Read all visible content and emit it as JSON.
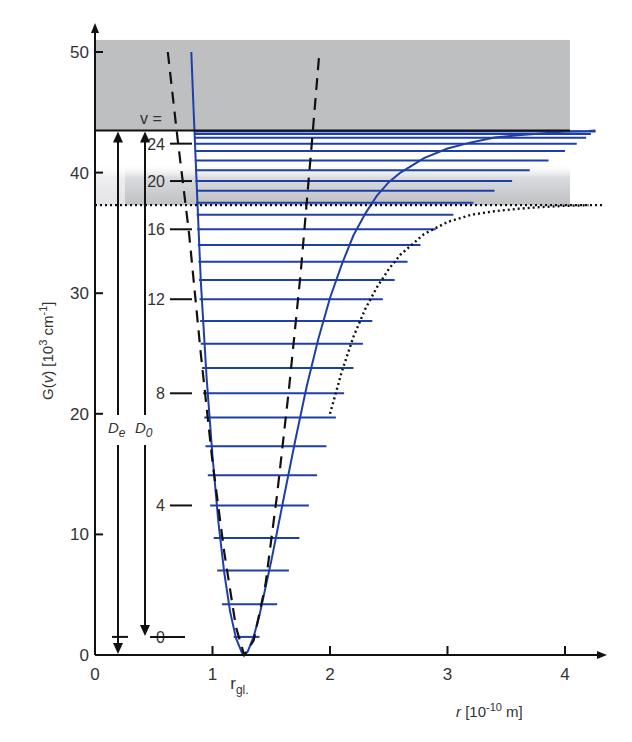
{
  "chart_data": {
    "type": "line",
    "title": "",
    "xlabel": "r [10^-10 m]",
    "xlabel_parts": {
      "var": "r",
      "unit_pre": " [10",
      "exp": "-10",
      "unit_post": " m]"
    },
    "ylabel": "G(v) [10^3 cm^-1]",
    "ylabel_parts": {
      "pre": "G(",
      "var": "v",
      "mid": ") [10",
      "exp": "3",
      "mid2": " cm",
      "exp2": "-1",
      "post": "]"
    },
    "xlim": [
      0,
      4.3
    ],
    "ylim": [
      0,
      51
    ],
    "x_ticks": [
      "0",
      "1",
      "2",
      "3",
      "4"
    ],
    "x_tick_values": [
      0,
      1,
      2,
      3,
      4
    ],
    "y_ticks": [
      "0",
      "10",
      "20",
      "30",
      "40",
      "50"
    ],
    "y_tick_values": [
      0,
      10,
      20,
      30,
      40,
      50
    ],
    "grid": false,
    "annotations": {
      "r_eq_label": "r",
      "r_eq_sub": "gl.",
      "r_eq": 1.27,
      "v_equals": "v =",
      "De_label": "D",
      "De_sub": "e",
      "D0_label": "D",
      "D0_sub": "0",
      "v_tick_labels": [
        "0",
        "4",
        "8",
        "12",
        "16",
        "20",
        "24"
      ]
    },
    "dissociation_limit_De": 43.5,
    "dissociation_limit_D0_dotted": 37.3,
    "zero_point_energy": 1.5,
    "vibrational_levels": {
      "v": [
        0,
        1,
        2,
        3,
        4,
        5,
        6,
        7,
        8,
        9,
        10,
        11,
        12,
        13,
        14,
        15,
        16,
        17,
        18,
        19,
        20,
        21,
        22,
        23,
        24,
        25,
        26,
        27
      ],
      "G": [
        1.5,
        4.2,
        7.0,
        9.7,
        12.4,
        14.9,
        17.3,
        19.7,
        21.7,
        23.8,
        25.8,
        27.7,
        29.5,
        31.1,
        32.6,
        34.0,
        35.3,
        36.5,
        37.5,
        38.5,
        39.3,
        40.2,
        41.0,
        41.8,
        42.4,
        42.9,
        43.2,
        43.4
      ],
      "r_min": [
        1.18,
        1.08,
        1.04,
        1.01,
        0.98,
        0.96,
        0.94,
        0.93,
        0.92,
        0.91,
        0.9,
        0.895,
        0.89,
        0.885,
        0.88,
        0.875,
        0.87,
        0.865,
        0.86,
        0.86,
        0.855,
        0.855,
        0.85,
        0.85,
        0.85,
        0.85,
        0.85,
        0.85
      ],
      "r_max": [
        1.4,
        1.55,
        1.65,
        1.74,
        1.82,
        1.89,
        1.97,
        2.05,
        2.12,
        2.2,
        2.28,
        2.36,
        2.45,
        2.55,
        2.66,
        2.77,
        2.9,
        3.05,
        3.22,
        3.4,
        3.55,
        3.7,
        3.86,
        4.0,
        4.1,
        4.18,
        4.22,
        4.26
      ]
    },
    "series": [
      {
        "name": "Morse potential (realistic)",
        "style": "solid",
        "color": "#1f3fa8",
        "x": [
          0.82,
          0.84,
          0.87,
          0.9,
          0.95,
          1.0,
          1.05,
          1.1,
          1.15,
          1.2,
          1.25,
          1.27,
          1.3,
          1.35,
          1.4,
          1.5,
          1.6,
          1.7,
          1.8,
          1.9,
          2.0,
          2.1,
          2.2,
          2.3,
          2.4,
          2.5,
          2.6,
          2.7,
          2.8,
          3.0,
          3.2,
          3.4,
          3.6,
          3.8,
          4.0,
          4.2,
          4.26
        ],
        "y": [
          50.0,
          45.0,
          38.0,
          31.0,
          23.0,
          16.5,
          11.0,
          6.8,
          3.6,
          1.4,
          0.2,
          0.0,
          0.3,
          1.5,
          3.3,
          7.8,
          12.7,
          17.6,
          22.2,
          26.2,
          29.6,
          32.4,
          34.8,
          36.6,
          38.1,
          39.2,
          40.0,
          40.6,
          41.2,
          42.0,
          42.5,
          42.9,
          43.1,
          43.25,
          43.4,
          43.45,
          43.5
        ]
      },
      {
        "name": "Harmonic oscillator (parabola)",
        "style": "dashed",
        "color": "#111111",
        "x": [
          0.62,
          0.7,
          0.8,
          0.9,
          1.0,
          1.1,
          1.2,
          1.27,
          1.35,
          1.45,
          1.55,
          1.65,
          1.75,
          1.85,
          1.91
        ],
        "y": [
          50.0,
          43.0,
          35.0,
          25.0,
          16.0,
          8.5,
          2.3,
          0.0,
          1.2,
          5.8,
          13.3,
          22.0,
          31.6,
          43.0,
          50.0
        ]
      },
      {
        "name": "Potential with D0 asymptote",
        "style": "dotted",
        "color": "#111111",
        "x": [
          2.0,
          2.1,
          2.2,
          2.3,
          2.4,
          2.5,
          2.6,
          2.8,
          3.0,
          3.2,
          3.4,
          3.6,
          3.8,
          4.0,
          4.2
        ],
        "y": [
          20.0,
          23.5,
          26.4,
          28.7,
          30.5,
          32.0,
          33.2,
          34.9,
          35.9,
          36.5,
          36.8,
          37.0,
          37.15,
          37.25,
          37.3
        ]
      }
    ],
    "shaded_regions": [
      {
        "name": "continuum",
        "y_from": 43.5,
        "y_to": 51,
        "color": "#bebfc1"
      },
      {
        "name": "band-gradient",
        "y_from": 37.3,
        "y_to": 40.8,
        "color": "#c8c9cc"
      }
    ]
  }
}
